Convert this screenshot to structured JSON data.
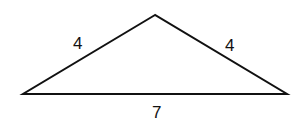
{
  "diagram": {
    "type": "triangle",
    "shape": "isosceles obtuse triangle",
    "vertices": {
      "apex": [
        155,
        15
      ],
      "left": [
        23,
        94
      ],
      "right": [
        287,
        94
      ]
    },
    "sides": [
      {
        "name": "left-side",
        "label": "4"
      },
      {
        "name": "right-side",
        "label": "4"
      },
      {
        "name": "base",
        "label": "7"
      }
    ],
    "stroke_color": "#111111"
  }
}
